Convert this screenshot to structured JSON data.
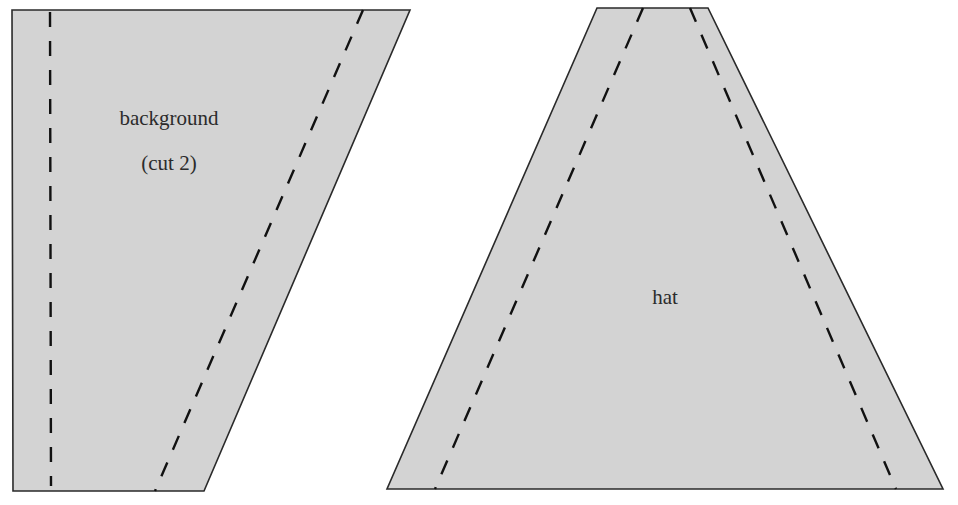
{
  "pieces": [
    {
      "name": "background",
      "label_line1": "background",
      "label_line2": "(cut 2)"
    },
    {
      "name": "hat",
      "label_line1": "hat"
    }
  ],
  "colors": {
    "fill": "#d3d3d3",
    "outline": "#2a2a2a",
    "seam": "#111111",
    "text": "#2b2b2b"
  }
}
